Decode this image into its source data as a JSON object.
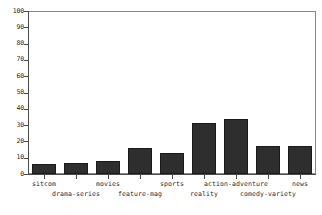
{
  "chart_data": {
    "type": "bar",
    "title": "",
    "subtitle": "",
    "xlabel": "",
    "ylabel": "",
    "ylim": [
      0,
      100
    ],
    "yticks": [
      0,
      10,
      20,
      30,
      40,
      50,
      60,
      70,
      80,
      90,
      100
    ],
    "grid": false,
    "legend": "none",
    "bar_color": "#2e2e2e",
    "axis_color": "#4a4a4a",
    "categories": [
      "sitcom",
      "drama-series",
      "movies",
      "feature-mag",
      "sports",
      "reality",
      "action-adventure",
      "comedy-variety",
      "news"
    ],
    "values": [
      6,
      7,
      8,
      16,
      13,
      31,
      34,
      17,
      17
    ]
  }
}
